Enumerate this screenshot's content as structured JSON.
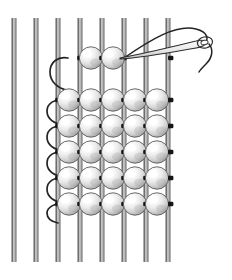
{
  "figure": {
    "caption": "Needle passing weft thread back through a row of beads on warp threads",
    "background_color": "#ffffff",
    "width": 232,
    "height": 280
  },
  "colors": {
    "warp_thread_dark": "#4a4a4a",
    "warp_thread_mid": "#8b8b8b",
    "warp_thread_light": "#d8d8d8",
    "weft_thread": "#2b2b2b",
    "bead_outline": "#555555",
    "bead_highlight": "#ffffff",
    "bead_mid": "#e2e2e2",
    "bead_shadow": "#9a9a9a",
    "needle_outline": "#3a3a3a",
    "needle_fill": "#f2f2f2"
  },
  "warp_threads": {
    "name": "vertical-warp-threads",
    "count": 8,
    "spacing": 22,
    "top": 18,
    "bottom": 262,
    "x_positions": [
      14,
      36,
      58,
      80,
      102,
      124,
      146,
      168
    ],
    "labels": [
      "warp-1",
      "warp-2",
      "warp-3",
      "warp-4",
      "warp-5",
      "warp-6",
      "warp-7",
      "warp-8"
    ]
  },
  "bead_grid": {
    "name": "bead-grid",
    "columns": 5,
    "rows": 6,
    "bead_radius": 11.5,
    "column_centers": [
      69,
      91,
      113,
      135,
      157
    ],
    "row_centers": [
      100,
      126,
      152,
      178,
      204,
      100
    ],
    "rows_y": [
      100,
      126,
      152,
      178,
      204,
      217
    ],
    "full_rows_y": [
      100,
      126,
      152,
      178,
      204
    ],
    "extra_row_y": 217
  },
  "active_row": {
    "name": "active-top-row",
    "y": 58,
    "bead_count": 2,
    "column_centers": [
      91,
      113
    ]
  },
  "weft_thread": {
    "name": "weft-thread",
    "left_loop_x": 55,
    "right_stub_x": 170,
    "tail_description": "thread tail curving down at left of active row"
  },
  "needle": {
    "name": "beading-needle",
    "tip_x": 118,
    "tip_y": 56,
    "eye_x": 208,
    "eye_y": 42,
    "length": 92,
    "description": "beading needle with eye threaded, angled up to the right"
  },
  "annotations": {
    "alt_text": "Instructional bead loom illustration: eight vertical warp threads, a woven block of five beads across by six rows, a partially completed top row of two beads, and a threaded beading needle returning through the top row."
  }
}
